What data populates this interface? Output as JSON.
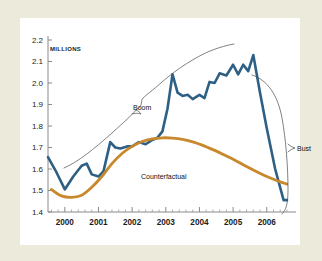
{
  "figure": {
    "units_label": "MILLIONS",
    "background_color": "#eceada",
    "card_color": "#ffffff"
  },
  "annotations": {
    "boom": "Boom",
    "bust": "Bust",
    "counterfactual": "Counterfactual"
  },
  "chart_data": {
    "type": "line",
    "title": "",
    "xlabel": "",
    "ylabel": "MILLIONS",
    "xlim": [
      1999.5,
      2006.75
    ],
    "ylim": [
      1.4,
      2.2
    ],
    "grid": false,
    "legend": "none",
    "xticks": [
      "2000",
      "2001",
      "2002",
      "2003",
      "2004",
      "2005",
      "2006"
    ],
    "xtick_values": [
      2000,
      2001,
      2002,
      2003,
      2004,
      2005,
      2006
    ],
    "yticks": [
      "1.4",
      "1.5",
      "1.6",
      "1.7",
      "1.8",
      "1.9",
      "2.0",
      "2.1",
      "2.2"
    ],
    "ytick_values": [
      1.4,
      1.5,
      1.6,
      1.7,
      1.8,
      1.9,
      2.0,
      2.1,
      2.2
    ],
    "minor_xticks_per_interval": 4,
    "series": [
      {
        "name": "Actual",
        "color": "#2e5f84",
        "width": 2.6,
        "x": [
          1999.5,
          1999.75,
          2000.0,
          2000.25,
          2000.5,
          2000.65,
          2000.8,
          2001.0,
          2001.15,
          2001.35,
          2001.5,
          2001.65,
          2001.85,
          2002.0,
          2002.2,
          2002.4,
          2002.6,
          2002.75,
          2002.9,
          2003.05,
          2003.2,
          2003.35,
          2003.5,
          2003.65,
          2003.8,
          2004.0,
          2004.15,
          2004.3,
          2004.45,
          2004.6,
          2004.8,
          2005.0,
          2005.15,
          2005.3,
          2005.45,
          2005.6,
          2005.8,
          2006.0,
          2006.25,
          2006.5,
          2006.6
        ],
        "values": [
          1.655,
          1.585,
          1.505,
          1.565,
          1.615,
          1.625,
          1.575,
          1.565,
          1.59,
          1.725,
          1.7,
          1.695,
          1.705,
          1.705,
          1.725,
          1.715,
          1.735,
          1.745,
          1.775,
          1.88,
          2.04,
          1.955,
          1.94,
          1.945,
          1.925,
          1.945,
          1.93,
          2.005,
          2.0,
          2.045,
          2.035,
          2.085,
          2.04,
          2.085,
          2.055,
          2.13,
          1.955,
          1.79,
          1.6,
          1.455,
          1.455
        ]
      },
      {
        "name": "Counterfactual",
        "color": "#c8882c",
        "width": 2.8,
        "x": [
          1999.6,
          1999.9,
          2000.2,
          2000.5,
          2000.8,
          2001.1,
          2001.4,
          2001.7,
          2002.0,
          2002.3,
          2002.6,
          2002.9,
          2003.2,
          2003.5,
          2003.8,
          2004.1,
          2004.4,
          2004.7,
          2005.0,
          2005.3,
          2005.6,
          2005.9,
          2006.2,
          2006.5,
          2006.6
        ],
        "values": [
          1.505,
          1.475,
          1.468,
          1.478,
          1.515,
          1.565,
          1.625,
          1.672,
          1.705,
          1.728,
          1.74,
          1.745,
          1.744,
          1.738,
          1.726,
          1.71,
          1.69,
          1.668,
          1.645,
          1.62,
          1.595,
          1.572,
          1.552,
          1.535,
          1.53
        ]
      }
    ],
    "braces": [
      {
        "name": "boom",
        "label": "Boom"
      },
      {
        "name": "bust",
        "label": "Bust"
      }
    ]
  }
}
